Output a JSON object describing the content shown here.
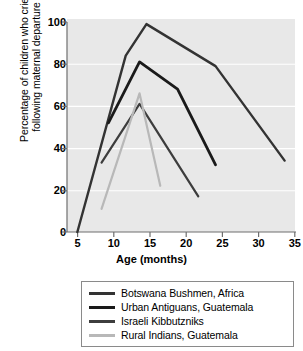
{
  "chart_data": {
    "type": "line",
    "title": "",
    "xlabel": "Age (months)",
    "ylabel_line1": "Percentage of children who cried",
    "ylabel_line2": "following maternal departure",
    "xlim": [
      3.5,
      36.5
    ],
    "ylim": [
      0,
      100
    ],
    "xticks": [
      5,
      10,
      15,
      20,
      25,
      30,
      35
    ],
    "yticks": [
      0,
      20,
      40,
      60,
      80,
      100
    ],
    "xticklabels": [
      "5",
      "10",
      "15",
      "20",
      "25",
      "30",
      "35"
    ],
    "yticklabels": [
      "0",
      "20",
      "40",
      "60",
      "80",
      "100"
    ],
    "grid": "horizontal-white",
    "plot_background": "#e8e8e8",
    "legend_position": "below-center",
    "series": [
      {
        "name": "Botswana Bushmen, Africa",
        "color": "#333333",
        "linewidth": 2.4,
        "x": [
          5,
          12,
          15,
          25,
          35
        ],
        "y": [
          0,
          84,
          99,
          79,
          34
        ]
      },
      {
        "name": "Urban Antiguans, Guatemala",
        "color": "#1a1a1a",
        "linewidth": 2.8,
        "x": [
          9.5,
          14,
          19.5,
          25
        ],
        "y": [
          52,
          81,
          68,
          32
        ]
      },
      {
        "name": "Israeli Kibbutzniks",
        "color": "#3d3d3d",
        "linewidth": 2.2,
        "x": [
          8.5,
          14,
          22.5
        ],
        "y": [
          33,
          61,
          17
        ]
      },
      {
        "name": "Rural Indians, Guatemala",
        "color": "#b8b8b8",
        "linewidth": 2.2,
        "x": [
          8.5,
          14,
          17
        ],
        "y": [
          11,
          66,
          22
        ]
      }
    ]
  },
  "legend": {
    "items": [
      {
        "label": "Botswana Bushmen, Africa",
        "color": "#333333"
      },
      {
        "label": "Urban Antiguans, Guatemala",
        "color": "#1a1a1a"
      },
      {
        "label": "Israeli Kibbutzniks",
        "color": "#3d3d3d"
      },
      {
        "label": "Rural Indians, Guatemala",
        "color": "#b8b8b8"
      }
    ]
  },
  "axes": {
    "x_title": "Age (months)",
    "y_title_line1": "Percentage of children who cried",
    "y_title_line2": "following maternal departure"
  }
}
